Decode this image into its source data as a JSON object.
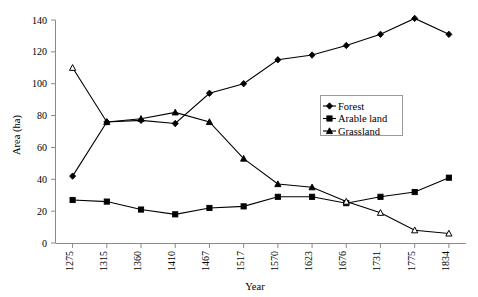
{
  "chart_data": {
    "type": "line",
    "title": "",
    "xlabel": "Year",
    "ylabel": "Area (ha)",
    "categories": [
      "1275",
      "1315",
      "1360",
      "1410",
      "1467",
      "1517",
      "1570",
      "1623",
      "1676",
      "1731",
      "1775",
      "1834"
    ],
    "ylim": [
      0,
      140
    ],
    "yticks": [
      0,
      20,
      40,
      60,
      80,
      100,
      120,
      140
    ],
    "grid": false,
    "legend_position": "upper-right",
    "series": [
      {
        "name": "Forest",
        "marker": "diamond",
        "color": "#000000",
        "values": [
          42,
          76,
          77,
          75,
          94,
          100,
          115,
          118,
          124,
          131,
          141,
          131
        ]
      },
      {
        "name": "Arable land",
        "marker": "square",
        "color": "#000000",
        "values": [
          27,
          26,
          21,
          18,
          22,
          23,
          29,
          29,
          25,
          29,
          32,
          41
        ]
      },
      {
        "name": "Grassland",
        "marker": "triangle",
        "color": "#000000",
        "values": [
          110,
          76,
          78,
          82,
          76,
          53,
          37,
          35,
          26,
          19,
          8,
          6
        ]
      }
    ]
  },
  "axis": {
    "y_title": "Area (ha)",
    "x_title": "Year",
    "y_tick_labels": [
      "0",
      "20",
      "40",
      "60",
      "80",
      "100",
      "120",
      "140"
    ],
    "x_tick_labels": [
      "1275",
      "1315",
      "1360",
      "1410",
      "1467",
      "1517",
      "1570",
      "1623",
      "1676",
      "1731",
      "1775",
      "1834"
    ]
  },
  "legend": {
    "items": [
      {
        "label": "Forest"
      },
      {
        "label": "Arable land"
      },
      {
        "label": "Grassland"
      }
    ]
  }
}
